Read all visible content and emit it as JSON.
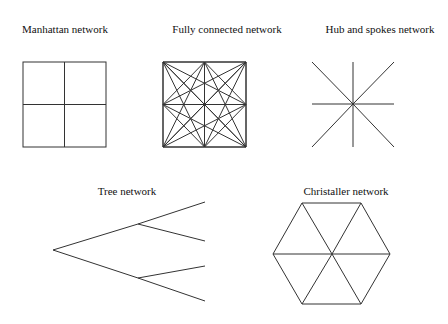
{
  "diagrams": [
    {
      "id": "manhattan",
      "label": "Manhattan network",
      "label_pos": [
        65,
        24
      ]
    },
    {
      "id": "fully-connected",
      "label": "Fully connected network",
      "label_pos": [
        227,
        24
      ]
    },
    {
      "id": "hub-spokes",
      "label": "Hub and spokes network",
      "label_pos": [
        380,
        24
      ]
    },
    {
      "id": "tree",
      "label": "Tree network",
      "label_pos": [
        127,
        186
      ]
    },
    {
      "id": "christaller",
      "label": "Christaller network",
      "label_pos": [
        346,
        186
      ]
    }
  ],
  "geometry": {
    "manhattan": {
      "x0": 23,
      "y0": 62,
      "x1": 106,
      "y1": 147
    },
    "fully_connected": {
      "x0": 163,
      "y0": 62,
      "x1": 246,
      "y1": 147
    },
    "hub": {
      "center": [
        353,
        104
      ],
      "x0": 312,
      "y0": 62,
      "x1": 394,
      "y1": 147
    },
    "tree": {
      "root": [
        53,
        250
      ],
      "branches": [
        [
          138,
          224
        ],
        [
          138,
          278
        ]
      ],
      "leaves": [
        [
          205,
          202
        ],
        [
          205,
          241
        ],
        [
          205,
          266
        ],
        [
          205,
          301
        ]
      ]
    },
    "christaller": {
      "center": [
        332,
        254
      ],
      "vertices": [
        [
          302,
          203
        ],
        [
          361,
          203
        ],
        [
          390,
          254
        ],
        [
          361,
          304
        ],
        [
          302,
          304
        ],
        [
          273,
          254
        ]
      ]
    }
  },
  "colors": {
    "stroke": "#333333",
    "background": "#ffffff",
    "text": "#111111"
  }
}
